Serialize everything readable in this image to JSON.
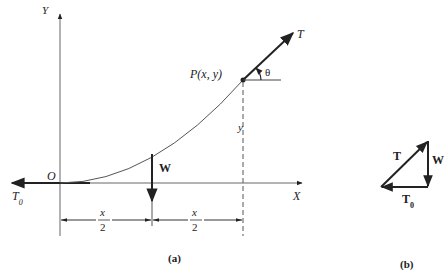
{
  "figure": {
    "panel_a": {
      "caption": "(a)",
      "axes": {
        "x_label": "X",
        "y_label": "Y",
        "origin_label": "O"
      },
      "point_label": "P(x, y)",
      "tension_label": "T",
      "horizontal_tension_label": "T",
      "horizontal_tension_sub": "0",
      "angle_label": "θ",
      "weight_label": "W",
      "height_label": "y",
      "dim_left": {
        "num": "x",
        "den": "2"
      },
      "dim_right": {
        "num": "x",
        "den": "2"
      }
    },
    "panel_b": {
      "caption": "(b)",
      "tension_label": "T",
      "weight_label": "W",
      "horizontal_tension_label": "T",
      "horizontal_tension_sub": "0"
    },
    "colors": {
      "ink": "#222222",
      "thin_line": "#555555",
      "background": "#ffffff"
    }
  }
}
